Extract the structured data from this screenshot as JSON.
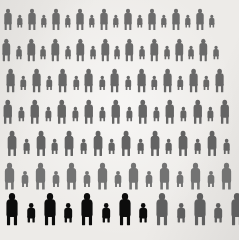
{
  "canvas": {
    "width": 239,
    "height": 240,
    "background": "#edebe8"
  },
  "palette": {
    "background": "#edebe8",
    "figure_grey": "#5b5b5b",
    "figure_grey_light": "#6e6e6e",
    "figure_grey_dark": "#4a4a4a",
    "figure_black": "#0c0c0c"
  },
  "legend": {
    "grey_label": "general population figure",
    "black_label": "highlighted subgroup figure"
  },
  "chart_data": {
    "type": "pictogram",
    "unit_label": "person",
    "icon": "person-icon",
    "total_figures": 121,
    "grey_figures": 111,
    "black_figures": 10,
    "rows": 7,
    "grid_note": "Alternating tall (adult) and short (child) figures; rows offset to suggest depth.",
    "row_data": [
      {
        "row": 1,
        "y": 8,
        "count": 18,
        "scale": 0.8,
        "color": "figure_grey",
        "offset": 2,
        "gap": 1.2,
        "highlight_count": 0
      },
      {
        "row": 2,
        "y": 38,
        "count": 18,
        "scale": 0.84,
        "color": "figure_grey",
        "offset": 0,
        "gap": 1.0,
        "highlight_count": 0
      },
      {
        "row": 3,
        "y": 68,
        "count": 17,
        "scale": 0.88,
        "color": "figure_grey",
        "offset": 4,
        "gap": 1.2,
        "highlight_count": 0
      },
      {
        "row": 4,
        "y": 99,
        "count": 17,
        "scale": 0.9,
        "color": "figure_grey",
        "offset": 1,
        "gap": 1.4,
        "highlight_count": 0
      },
      {
        "row": 5,
        "y": 130,
        "count": 16,
        "scale": 0.94,
        "color": "figure_grey",
        "offset": 5,
        "gap": 1.6,
        "highlight_count": 0
      },
      {
        "row": 6,
        "y": 162,
        "count": 15,
        "scale": 1.0,
        "color": "figure_grey_light",
        "offset": 2,
        "gap": 2.0,
        "highlight_count": 0
      },
      {
        "row": 7,
        "y": 192,
        "count": 14,
        "scale": 1.2,
        "color": "figure_grey",
        "offset": 3,
        "gap": 2.6,
        "highlight_count": 8
      }
    ]
  }
}
